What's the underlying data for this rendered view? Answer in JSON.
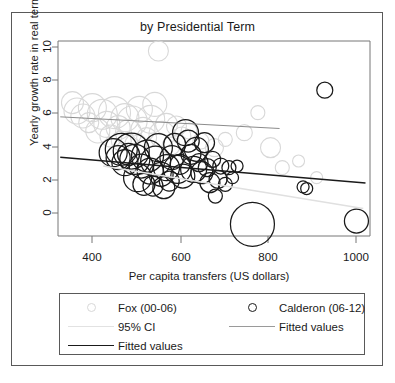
{
  "chart_data": {
    "type": "scatter",
    "title": "by Presidential Term",
    "xlabel": "Per capita transfers (US dollars)",
    "ylabel": "Yearly growth rate in real terms",
    "xlim": [
      330,
      1020
    ],
    "ylim": [
      -1.1,
      10.6
    ],
    "xticks": [
      400,
      600,
      800,
      1000
    ],
    "yticks": [
      0,
      2,
      4,
      6,
      8,
      10
    ],
    "grid": false,
    "legend_position": "below-axes",
    "marker": "open-circle",
    "size_encoding": "bubble area",
    "series": [
      {
        "name": "Fox (00-06)",
        "color": "#d8d8d8",
        "points": [
          {
            "x": 362,
            "y": 6.9,
            "r": 11
          },
          {
            "x": 372,
            "y": 6.4,
            "r": 13
          },
          {
            "x": 385,
            "y": 6.1,
            "r": 12
          },
          {
            "x": 398,
            "y": 5.7,
            "r": 10
          },
          {
            "x": 406,
            "y": 6.6,
            "r": 14
          },
          {
            "x": 418,
            "y": 5.2,
            "r": 12
          },
          {
            "x": 428,
            "y": 6.2,
            "r": 15
          },
          {
            "x": 438,
            "y": 5.6,
            "r": 13
          },
          {
            "x": 447,
            "y": 4.9,
            "r": 11
          },
          {
            "x": 455,
            "y": 6.3,
            "r": 16
          },
          {
            "x": 463,
            "y": 5.4,
            "r": 12
          },
          {
            "x": 470,
            "y": 4.6,
            "r": 10
          },
          {
            "x": 478,
            "y": 6.0,
            "r": 14
          },
          {
            "x": 486,
            "y": 5.1,
            "r": 13
          },
          {
            "x": 494,
            "y": 5.8,
            "r": 15
          },
          {
            "x": 502,
            "y": 4.4,
            "r": 11
          },
          {
            "x": 510,
            "y": 6.5,
            "r": 13
          },
          {
            "x": 518,
            "y": 5.3,
            "r": 12
          },
          {
            "x": 526,
            "y": 4.8,
            "r": 10
          },
          {
            "x": 535,
            "y": 5.9,
            "r": 14
          },
          {
            "x": 544,
            "y": 6.8,
            "r": 12
          },
          {
            "x": 552,
            "y": 10.0,
            "r": 10
          },
          {
            "x": 560,
            "y": 5.0,
            "r": 13
          },
          {
            "x": 570,
            "y": 5.6,
            "r": 11
          },
          {
            "x": 580,
            "y": 4.3,
            "r": 9
          },
          {
            "x": 592,
            "y": 5.5,
            "r": 10
          },
          {
            "x": 604,
            "y": 4.9,
            "r": 9
          },
          {
            "x": 620,
            "y": 5.2,
            "r": 8
          },
          {
            "x": 646,
            "y": 4.6,
            "r": 8
          },
          {
            "x": 676,
            "y": 4.2,
            "r": 9
          },
          {
            "x": 700,
            "y": 4.7,
            "r": 7
          },
          {
            "x": 742,
            "y": 5.1,
            "r": 8
          },
          {
            "x": 772,
            "y": 6.3,
            "r": 7
          },
          {
            "x": 800,
            "y": 4.2,
            "r": 10
          },
          {
            "x": 826,
            "y": 3.0,
            "r": 7
          },
          {
            "x": 862,
            "y": 3.4,
            "r": 6
          },
          {
            "x": 902,
            "y": 2.4,
            "r": 6
          }
        ],
        "fit": {
          "x0": 335,
          "y0": 6.05,
          "x1": 820,
          "y1": 5.35
        }
      },
      {
        "name": "Calderon (06-12)",
        "color": "#1a1a1a",
        "points": [
          {
            "x": 452,
            "y": 3.9,
            "r": 14
          },
          {
            "x": 463,
            "y": 3.6,
            "r": 12
          },
          {
            "x": 470,
            "y": 4.1,
            "r": 16
          },
          {
            "x": 478,
            "y": 3.3,
            "r": 13
          },
          {
            "x": 486,
            "y": 3.8,
            "r": 11
          },
          {
            "x": 492,
            "y": 4.0,
            "r": 18
          },
          {
            "x": 500,
            "y": 3.5,
            "r": 15
          },
          {
            "x": 506,
            "y": 2.4,
            "r": 14
          },
          {
            "x": 514,
            "y": 3.1,
            "r": 12
          },
          {
            "x": 520,
            "y": 2.0,
            "r": 11
          },
          {
            "x": 528,
            "y": 3.7,
            "r": 16
          },
          {
            "x": 534,
            "y": 2.8,
            "r": 13
          },
          {
            "x": 540,
            "y": 1.9,
            "r": 10
          },
          {
            "x": 546,
            "y": 3.4,
            "r": 15
          },
          {
            "x": 552,
            "y": 4.2,
            "r": 14
          },
          {
            "x": 558,
            "y": 2.6,
            "r": 12
          },
          {
            "x": 564,
            "y": 1.8,
            "r": 11
          },
          {
            "x": 570,
            "y": 3.0,
            "r": 13
          },
          {
            "x": 576,
            "y": 2.2,
            "r": 10
          },
          {
            "x": 582,
            "y": 3.6,
            "r": 12
          },
          {
            "x": 588,
            "y": 4.4,
            "r": 11
          },
          {
            "x": 594,
            "y": 2.9,
            "r": 14
          },
          {
            "x": 600,
            "y": 3.2,
            "r": 10
          },
          {
            "x": 606,
            "y": 2.5,
            "r": 12
          },
          {
            "x": 612,
            "y": 5.1,
            "r": 13
          },
          {
            "x": 618,
            "y": 4.6,
            "r": 11
          },
          {
            "x": 624,
            "y": 3.8,
            "r": 10
          },
          {
            "x": 630,
            "y": 2.9,
            "r": 13
          },
          {
            "x": 636,
            "y": 4.1,
            "r": 12
          },
          {
            "x": 642,
            "y": 3.3,
            "r": 9
          },
          {
            "x": 648,
            "y": 2.7,
            "r": 11
          },
          {
            "x": 654,
            "y": 4.5,
            "r": 10
          },
          {
            "x": 660,
            "y": 3.0,
            "r": 9
          },
          {
            "x": 666,
            "y": 2.1,
            "r": 10
          },
          {
            "x": 672,
            "y": 3.5,
            "r": 8
          },
          {
            "x": 678,
            "y": 1.3,
            "r": 7
          },
          {
            "x": 684,
            "y": 2.3,
            "r": 9
          },
          {
            "x": 690,
            "y": 3.1,
            "r": 8
          },
          {
            "x": 700,
            "y": 2.0,
            "r": 7
          },
          {
            "x": 708,
            "y": 3.0,
            "r": 7
          },
          {
            "x": 716,
            "y": 2.4,
            "r": 6
          },
          {
            "x": 726,
            "y": 3.1,
            "r": 6
          },
          {
            "x": 760,
            "y": -0.4,
            "r": 22
          },
          {
            "x": 872,
            "y": 1.85,
            "r": 6
          },
          {
            "x": 880,
            "y": 1.75,
            "r": 6
          },
          {
            "x": 920,
            "y": 7.65,
            "r": 8
          },
          {
            "x": 990,
            "y": -0.2,
            "r": 12
          }
        ],
        "fit": {
          "x0": 335,
          "y0": 3.62,
          "x1": 1010,
          "y1": 2.08
        }
      }
    ],
    "ci_band": {
      "label": "95% CI",
      "color": "#d8d8d8"
    }
  },
  "legend": {
    "entries": [
      {
        "key": "circle",
        "color": "#d8d8d8",
        "label": "Fox (00-06)"
      },
      {
        "key": "circle",
        "color": "#1a1a1a",
        "label": "Calderon (06-12)"
      },
      {
        "key": "line",
        "color": "#d8d8d8",
        "label": "95% CI"
      },
      {
        "key": "line",
        "color": "#9a9a9a",
        "label": "Fitted values"
      },
      {
        "key": "line",
        "color": "#1a1a1a",
        "label": "Fitted values"
      }
    ]
  },
  "axes": {
    "xticklabels": [
      "400",
      "600",
      "800",
      "1000"
    ],
    "yticklabels": [
      "0",
      "2",
      "4",
      "6",
      "8",
      "10"
    ]
  }
}
